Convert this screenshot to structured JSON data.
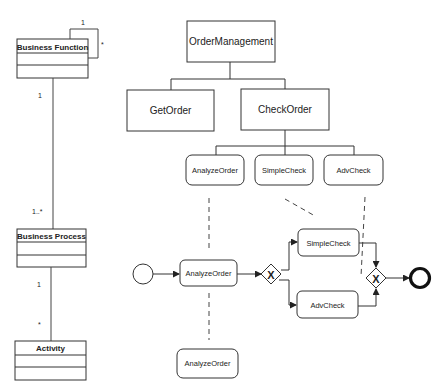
{
  "uml": {
    "classes": [
      {
        "name": "Business Function"
      },
      {
        "name": "Business Process"
      },
      {
        "name": "Activity"
      }
    ],
    "self_assoc": {
      "mult_top": "1",
      "mult_right": "*"
    },
    "assoc1": {
      "mult_top": "1",
      "mult_bottom": "1..*"
    },
    "assoc2": {
      "mult_top": "1",
      "mult_bottom": "*"
    }
  },
  "hierarchy": {
    "root": "OrderManagement",
    "level2": [
      "GetOrder",
      "CheckOrder"
    ],
    "level3": [
      "AnalyzeOrder",
      "SimpleCheck",
      "AdvCheck"
    ]
  },
  "process": {
    "tasks": [
      "AnalyzeOrder",
      "SimpleCheck",
      "AdvCheck"
    ],
    "bottom_task": "AnalyzeOrder",
    "gateway_symbol": "X"
  }
}
